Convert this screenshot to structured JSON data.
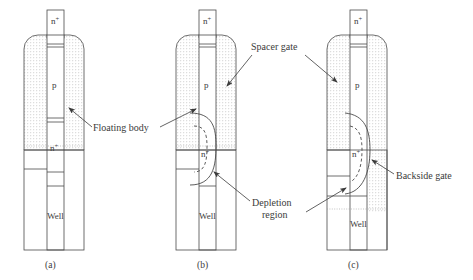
{
  "figure": {
    "type": "semiconductor-device-cross-section-diagram",
    "background_color": "#ffffff",
    "line_color": "#4a4a4a",
    "text_color": "#3b3b3b",
    "hatch_color": "#9a9a9a",
    "panels": [
      {
        "id": "a",
        "caption": "(a)",
        "region_labels": {
          "top_contact": "n",
          "top_contact_sup": "+",
          "body": "p",
          "mid_contact": "n",
          "mid_contact_sup": "+",
          "substrate": "Well"
        },
        "has_depletion_region": false,
        "backside_gate_extended": false
      },
      {
        "id": "b",
        "caption": "(b)",
        "region_labels": {
          "top_contact": "n",
          "top_contact_sup": "+",
          "body": "p",
          "mid_contact": "n",
          "mid_contact_sup": "+",
          "substrate": "Well"
        },
        "has_depletion_region": true,
        "backside_gate_extended": false
      },
      {
        "id": "c",
        "caption": "(c)",
        "region_labels": {
          "top_contact": "n",
          "top_contact_sup": "+",
          "body": "p",
          "mid_contact": "n",
          "mid_contact_sup": "+",
          "substrate": "Well"
        },
        "has_depletion_region": true,
        "backside_gate_extended": true
      }
    ],
    "callouts": [
      {
        "id": "floating-body",
        "text": "Floating body",
        "lines": [
          "Floating body"
        ]
      },
      {
        "id": "spacer-gate",
        "text": "Spacer gate",
        "lines": [
          "Spacer gate"
        ]
      },
      {
        "id": "depletion-region",
        "text": "Depletion region",
        "lines": [
          "Depletion",
          "region"
        ]
      },
      {
        "id": "backside-gate",
        "text": "Backside gate",
        "lines": [
          "Backside gate"
        ]
      }
    ]
  }
}
